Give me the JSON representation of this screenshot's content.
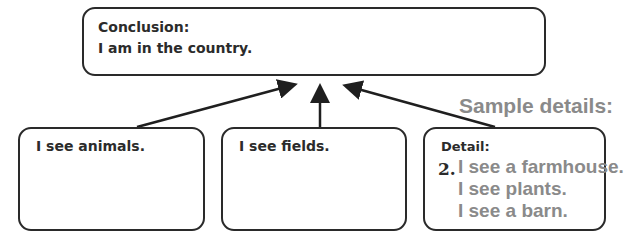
{
  "conclusion": {
    "heading": "Conclusion:",
    "text": "I am in the country."
  },
  "details": [
    {
      "text": "I see animals."
    },
    {
      "text": "I see fields."
    },
    {
      "heading": "Detail:",
      "number": "2.",
      "samples": [
        "I see a farmhouse.",
        "I see plants.",
        "I see a barn."
      ]
    }
  ],
  "sample_label": "Sample details:",
  "colors": {
    "border": "#2a2a2a",
    "text": "#2b2b2b",
    "sample": "#8a8a8a"
  }
}
